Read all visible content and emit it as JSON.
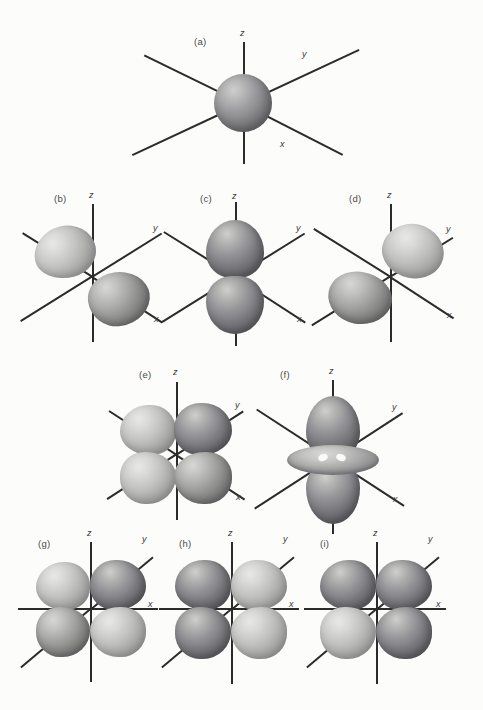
{
  "figure": {
    "background_color": "#fcfcfb",
    "axis_color": "#2b2b2b",
    "lobe_color": "#8d8d8b",
    "panel_count": 9
  },
  "axis_labels": {
    "x": "x",
    "y": "y",
    "z": "z"
  },
  "panels": [
    {
      "label": "(a)",
      "orbital": "s",
      "shape": "sphere",
      "axes": [
        "z",
        "y",
        "x"
      ],
      "axis_style": "three-axis-perspective",
      "lobes": 1
    },
    {
      "label": "(b)",
      "orbital": "p-x",
      "shape": "two-lobe",
      "axes": [
        "z",
        "y",
        "x"
      ],
      "axis_style": "three-axis-perspective",
      "lobes": 2,
      "lobe_axis": "x"
    },
    {
      "label": "(c)",
      "orbital": "p-z",
      "shape": "two-lobe",
      "axes": [
        "z",
        "y",
        "x"
      ],
      "axis_style": "three-axis-perspective",
      "lobes": 2,
      "lobe_axis": "z"
    },
    {
      "label": "(d)",
      "orbital": "p-y",
      "shape": "two-lobe",
      "axes": [
        "z",
        "y",
        "x"
      ],
      "axis_style": "three-axis-perspective",
      "lobes": 2,
      "lobe_axis": "y"
    },
    {
      "label": "(e)",
      "orbital": "d-four-lobe",
      "shape": "four-lobe-clover",
      "axes": [
        "z",
        "y",
        "x"
      ],
      "axis_style": "three-axis-perspective",
      "lobes": 4
    },
    {
      "label": "(f)",
      "orbital": "d-z-squared",
      "shape": "two-lobe-with-torus",
      "axes": [
        "z",
        "y",
        "x"
      ],
      "axis_style": "three-axis-perspective",
      "lobes": 2,
      "has_torus": true
    },
    {
      "label": "(g)",
      "orbital": "d-four-lobe",
      "shape": "four-lobe-clover",
      "axes": [
        "z",
        "y",
        "x"
      ],
      "axis_style": "x-horizontal-y-diagonal",
      "lobes": 4
    },
    {
      "label": "(h)",
      "orbital": "d-four-lobe",
      "shape": "four-lobe-clover",
      "axes": [
        "z",
        "y",
        "x"
      ],
      "axis_style": "x-horizontal-y-diagonal",
      "lobes": 4
    },
    {
      "label": "(i)",
      "orbital": "d-four-lobe",
      "shape": "four-lobe-clover",
      "axes": [
        "z",
        "y",
        "x"
      ],
      "axis_style": "x-horizontal-y-diagonal",
      "lobes": 4
    }
  ]
}
